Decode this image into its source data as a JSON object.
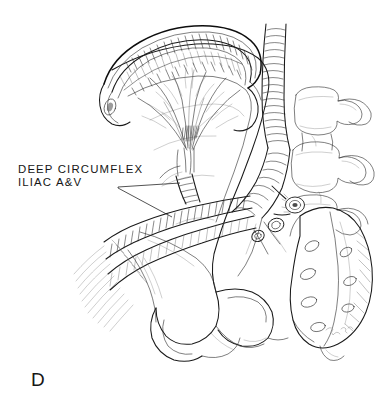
{
  "figure": {
    "panel_letter": "D",
    "background_color": "#ffffff",
    "ink_color": "#1a1a1a",
    "width": 385,
    "height": 404
  },
  "annotations": {
    "dcia": {
      "line1": "DEEP CIRCUMFLEX",
      "line2": "ILIAC A&V",
      "full_text": "DEEP CIRCUMFLEX\nILIAC A&V"
    }
  },
  "structures": [
    {
      "name": "iliac-crest-bone-flap",
      "label": "iliac crest bone flap"
    },
    {
      "name": "periosteal-vascular-pedicle",
      "label": "periosteal vascular branches"
    },
    {
      "name": "deep-circumflex-iliac-artery",
      "label": "deep circumflex iliac artery"
    },
    {
      "name": "deep-circumflex-iliac-vein",
      "label": "deep circumflex iliac vein"
    },
    {
      "name": "external-iliac-vessels",
      "label": "external iliac artery and vein"
    },
    {
      "name": "common-iliac-vessels",
      "label": "common iliac vessels"
    },
    {
      "name": "aorta",
      "label": "abdominal aorta"
    },
    {
      "name": "lumbar-vertebrae",
      "label": "lumbar vertebrae"
    },
    {
      "name": "sacrum",
      "label": "sacrum"
    },
    {
      "name": "iliac-fossa",
      "label": "iliac fossa"
    },
    {
      "name": "greater-sciatic-notch",
      "label": "greater sciatic notch"
    }
  ]
}
